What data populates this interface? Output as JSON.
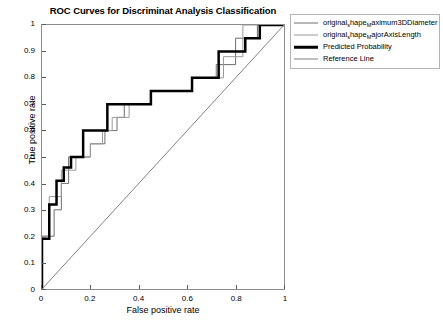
{
  "chart_data": {
    "type": "line",
    "title": "ROC Curves for Discriminat Analysis Classification",
    "xlabel": "False positive rate",
    "ylabel": "True positive rate",
    "xlim": [
      0,
      1
    ],
    "ylim": [
      0,
      1
    ],
    "xticks": [
      "0",
      "0.2",
      "0.4",
      "0.6",
      "0.8",
      "1"
    ],
    "xtick_values": [
      0,
      0.2,
      0.4,
      0.6,
      0.8,
      1
    ],
    "yticks": [
      "0",
      "0.1",
      "0.2",
      "0.3",
      "0.4",
      "0.5",
      "0.6",
      "0.7",
      "0.8",
      "0.9",
      "1"
    ],
    "ytick_values": [
      0,
      0.1,
      0.2,
      0.3,
      0.4,
      0.5,
      0.6,
      0.7,
      0.8,
      0.9,
      1
    ],
    "grid": false,
    "legend_position": "outside-top-right",
    "series": [
      {
        "name": "original_shape_Maximum3DDiameter",
        "display": "original_hape_aximum3DDiameter",
        "prefix": "original",
        "sub1": "s",
        "mid": "hape",
        "sub2": "M",
        "suffix": "aximum3DDiameter",
        "color": "#6e6e6e",
        "width": 1,
        "style": "step",
        "points": [
          [
            0.0,
            0.0
          ],
          [
            0.0,
            0.2
          ],
          [
            0.05,
            0.2
          ],
          [
            0.05,
            0.3
          ],
          [
            0.08,
            0.3
          ],
          [
            0.08,
            0.4
          ],
          [
            0.11,
            0.4
          ],
          [
            0.11,
            0.5
          ],
          [
            0.2,
            0.5
          ],
          [
            0.2,
            0.55
          ],
          [
            0.26,
            0.55
          ],
          [
            0.26,
            0.6
          ],
          [
            0.31,
            0.6
          ],
          [
            0.31,
            0.65
          ],
          [
            0.34,
            0.65
          ],
          [
            0.34,
            0.7
          ],
          [
            0.45,
            0.7
          ],
          [
            0.45,
            0.75
          ],
          [
            0.62,
            0.75
          ],
          [
            0.62,
            0.8
          ],
          [
            0.72,
            0.8
          ],
          [
            0.72,
            0.85
          ],
          [
            0.8,
            0.85
          ],
          [
            0.8,
            0.95
          ],
          [
            0.89,
            0.95
          ],
          [
            0.89,
            1.0
          ],
          [
            1.0,
            1.0
          ]
        ]
      },
      {
        "name": "original_shape_MajorAxisLength",
        "display": "original_hape_ajorAxisLength",
        "prefix": "original",
        "sub1": "s",
        "mid": "hape",
        "sub2": "M",
        "suffix": "ajorAxisLength",
        "color": "#9a9a9a",
        "width": 1,
        "style": "step",
        "points": [
          [
            0.0,
            0.0
          ],
          [
            0.0,
            0.2
          ],
          [
            0.03,
            0.2
          ],
          [
            0.03,
            0.35
          ],
          [
            0.08,
            0.35
          ],
          [
            0.08,
            0.45
          ],
          [
            0.14,
            0.45
          ],
          [
            0.14,
            0.5
          ],
          [
            0.2,
            0.5
          ],
          [
            0.2,
            0.55
          ],
          [
            0.25,
            0.55
          ],
          [
            0.25,
            0.6
          ],
          [
            0.29,
            0.6
          ],
          [
            0.29,
            0.65
          ],
          [
            0.36,
            0.65
          ],
          [
            0.36,
            0.7
          ],
          [
            0.45,
            0.7
          ],
          [
            0.45,
            0.75
          ],
          [
            0.62,
            0.75
          ],
          [
            0.62,
            0.8
          ],
          [
            0.75,
            0.8
          ],
          [
            0.75,
            0.88
          ],
          [
            0.83,
            0.88
          ],
          [
            0.83,
            1.0
          ],
          [
            1.0,
            1.0
          ]
        ]
      },
      {
        "name": "Predicted Probability",
        "display": "Predicted Probability",
        "color": "#000000",
        "width": 2.5,
        "style": "step",
        "points": [
          [
            0.0,
            0.0
          ],
          [
            0.0,
            0.19
          ],
          [
            0.03,
            0.19
          ],
          [
            0.03,
            0.32
          ],
          [
            0.06,
            0.32
          ],
          [
            0.06,
            0.41
          ],
          [
            0.09,
            0.41
          ],
          [
            0.09,
            0.46
          ],
          [
            0.12,
            0.46
          ],
          [
            0.12,
            0.5
          ],
          [
            0.17,
            0.5
          ],
          [
            0.17,
            0.6
          ],
          [
            0.27,
            0.6
          ],
          [
            0.27,
            0.7
          ],
          [
            0.45,
            0.7
          ],
          [
            0.45,
            0.75
          ],
          [
            0.62,
            0.75
          ],
          [
            0.62,
            0.8
          ],
          [
            0.73,
            0.8
          ],
          [
            0.73,
            0.9
          ],
          [
            0.84,
            0.9
          ],
          [
            0.84,
            0.95
          ],
          [
            0.9,
            0.95
          ],
          [
            0.9,
            1.0
          ],
          [
            1.0,
            1.0
          ]
        ]
      },
      {
        "name": "Reference Line",
        "display": "Reference Line",
        "color": "#808080",
        "width": 1,
        "style": "line",
        "points": [
          [
            0.0,
            0.0
          ],
          [
            1.0,
            1.0
          ]
        ]
      }
    ]
  },
  "legend": {
    "items": [
      {
        "label": "original_hape_aximum3DDiameter",
        "swatch": "sw-thin"
      },
      {
        "label": "original_hape_ajorAxisLength",
        "swatch": "sw-thin2"
      },
      {
        "label": "Predicted Probability",
        "swatch": "sw-thick"
      },
      {
        "label": "Reference Line",
        "swatch": "sw-ref"
      }
    ]
  }
}
